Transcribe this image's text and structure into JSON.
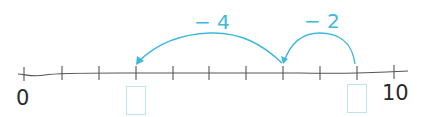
{
  "number_line": {
    "start_label": "0",
    "end_label": "10",
    "min": 0,
    "max": 10,
    "tick_count": 11,
    "line_color": "#555555",
    "accent_color": "#3fb8dc"
  },
  "jumps": [
    {
      "label": "− 2",
      "from": 9,
      "to": 7
    },
    {
      "label": "− 4",
      "from": 7,
      "to": 3
    }
  ],
  "answer_boxes": [
    {
      "position": 3,
      "value": ""
    },
    {
      "position": 9,
      "value": ""
    }
  ]
}
